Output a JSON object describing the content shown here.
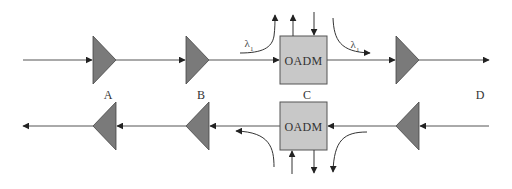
{
  "diagram": {
    "title": "",
    "colors": {
      "line": "#3a3a3a",
      "amplifier_fill": "#7a7a7a",
      "oadm_fill": "#c8c8c8",
      "oadm_stroke": "#555555",
      "background": "#ffffff"
    },
    "nodes": {
      "A": {
        "label": "A"
      },
      "B": {
        "label": "B"
      },
      "C": {
        "label": "C"
      },
      "D": {
        "label": "D"
      }
    },
    "top_oadm": {
      "label": "OADM"
    },
    "bottom_oadm": {
      "label": "OADM"
    },
    "wavelength_labels": {
      "drop_symbol": "λ",
      "drop_subscript": "1",
      "add_symbol": "λ",
      "add_subscript": "1"
    },
    "links": [
      {
        "from": "input",
        "to": "amp-A-top",
        "direction": "east"
      },
      {
        "from": "amp-A-top",
        "to": "amp-B-top",
        "direction": "east"
      },
      {
        "from": "amp-B-top",
        "to": "top-oadm",
        "direction": "east"
      },
      {
        "from": "top-oadm",
        "to": "amp-D-top",
        "direction": "east"
      },
      {
        "from": "amp-D-top",
        "to": "output",
        "direction": "east"
      },
      {
        "from": "input-bottom",
        "to": "amp-D-bottom",
        "direction": "west"
      },
      {
        "from": "amp-D-bottom",
        "to": "bottom-oadm",
        "direction": "west"
      },
      {
        "from": "bottom-oadm",
        "to": "amp-B-bottom",
        "direction": "west"
      },
      {
        "from": "amp-B-bottom",
        "to": "amp-A-bottom",
        "direction": "west"
      },
      {
        "from": "amp-A-bottom",
        "to": "output-bottom",
        "direction": "west"
      }
    ]
  }
}
